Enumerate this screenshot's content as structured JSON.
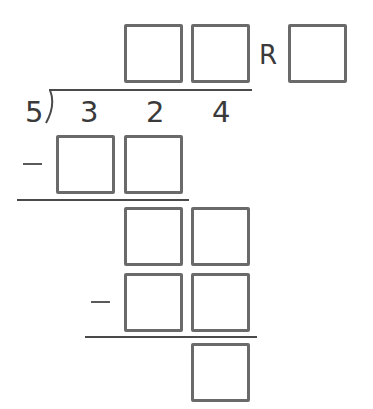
{
  "problem": {
    "type": "long-division-worksheet",
    "divisor": "5",
    "dividend_digits": [
      "3",
      "2",
      "4"
    ],
    "remainder_label": "R",
    "minus_sign": "−"
  },
  "quotient": {
    "boxes": [
      "",
      ""
    ],
    "remainder_box": ""
  },
  "steps": [
    {
      "label": "first-subtrahend",
      "boxes": [
        "",
        ""
      ]
    },
    {
      "label": "first-difference",
      "boxes": [
        "",
        ""
      ]
    },
    {
      "label": "second-subtrahend",
      "boxes": [
        "",
        ""
      ]
    },
    {
      "label": "final-remainder",
      "boxes": [
        ""
      ]
    }
  ],
  "colors": {
    "box_border": "#6a6a6a",
    "text": "#3a3a3a",
    "line": "#4a4a4a",
    "background": "#ffffff"
  }
}
